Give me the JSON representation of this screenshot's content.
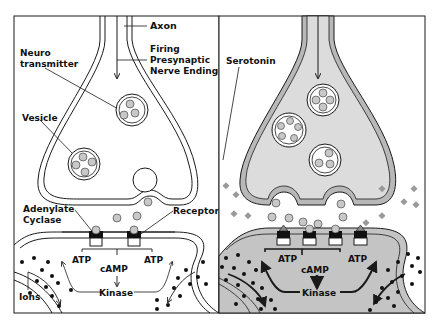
{
  "diagram": {
    "colors": {
      "background": "#ffffff",
      "line": "#1a1a1a",
      "membrane_fill_right": "#b8b8b8",
      "cytoplasm_right": "#dcdcdc",
      "postsynaptic_fill_right": "#c4c4c4",
      "neurotransmitter": "#c8c8c8",
      "serotonin_square": "#9a9a9a",
      "ion": "#111111"
    },
    "left_panel": {
      "labels": {
        "axon": "Axon",
        "firing": "Firing",
        "presynaptic": "Presynaptic",
        "nerve_ending": "Nerve Ending",
        "neuro": "Neuro",
        "transmitter": "transmitter",
        "vesicle": "Vesicle",
        "adenylate": "Adenylate",
        "cyclase": "Cyclase",
        "receptor": "Receptor",
        "atp_left": "ATP",
        "atp_right": "ATP",
        "camp": "cAMP",
        "kinase": "Kinase",
        "ions": "Ions"
      }
    },
    "right_panel": {
      "labels": {
        "serotonin": "Serotonin",
        "atp_left": "ATP",
        "atp_right": "ATP",
        "camp": "cAMP",
        "kinase": "Kinase"
      }
    }
  }
}
